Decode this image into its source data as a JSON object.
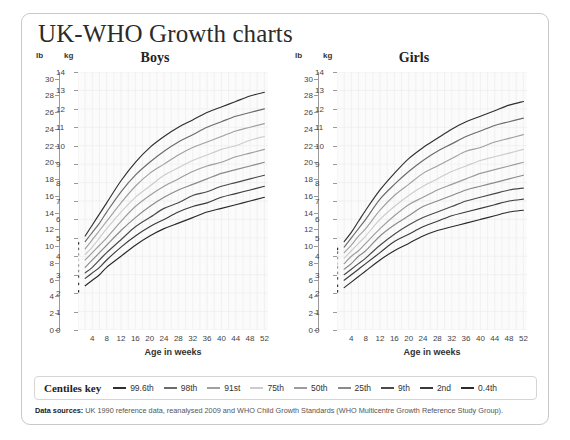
{
  "header": {
    "title": "UK-WHO Growth charts"
  },
  "units": {
    "lb": "lb",
    "kg": "kg"
  },
  "axis": {
    "lb_ticks": [
      30,
      28,
      26,
      24,
      22,
      20,
      18,
      16,
      14,
      12,
      10,
      8,
      6,
      4,
      2,
      0
    ],
    "kg_ticks": [
      14,
      13,
      12,
      11,
      10,
      9,
      8,
      7,
      6,
      5,
      4,
      3,
      2,
      1,
      0
    ],
    "x_ticks": [
      4,
      8,
      12,
      16,
      20,
      24,
      28,
      32,
      36,
      40,
      44,
      48,
      52
    ],
    "x_title": "Age in weeks"
  },
  "legend": {
    "title": "Centiles key",
    "items": [
      {
        "label": "99.6th",
        "color": "#2f2f2f"
      },
      {
        "label": "98th",
        "color": "#6b6b6b"
      },
      {
        "label": "91st",
        "color": "#a0a0a0"
      },
      {
        "label": "75th",
        "color": "#cccccc"
      },
      {
        "label": "50th",
        "color": "#9d9d9d"
      },
      {
        "label": "25th",
        "color": "#8a8a8a"
      },
      {
        "label": "9th",
        "color": "#4a4a4a"
      },
      {
        "label": "2nd",
        "color": "#3a3a3a"
      },
      {
        "label": "0.4th",
        "color": "#2a2a2a"
      }
    ]
  },
  "footer": {
    "label": "Data sources:",
    "text": " UK 1990 reference data, reanalysed 2009 and WHO Child Growth Standards (WHO Multicentre Growth Reference Study Group)."
  },
  "chart_data": {
    "type": "line",
    "title": "UK-WHO Growth charts",
    "xlabel": "Age in weeks",
    "ylabel": "kg",
    "ylabel_secondary": "lb",
    "xlim": [
      0,
      53
    ],
    "ylim": [
      0,
      14
    ],
    "ylim_lb": [
      0,
      30.8
    ],
    "grid": true,
    "legend_position": "bottom",
    "panels": [
      {
        "name": "Boys",
        "title": "Boys",
        "x": [
          0,
          2,
          4,
          6,
          8,
          12,
          16,
          20,
          24,
          28,
          32,
          36,
          40,
          44,
          48,
          52
        ],
        "birth_dots_kg": [
          4.7,
          4.4,
          4.1,
          3.8,
          3.5,
          3.2,
          2.9,
          2.5,
          2.1
        ],
        "series": [
          {
            "name": "99.6th",
            "color": "#2f2f2f",
            "values": [
              4.7,
              5.1,
              5.7,
              6.3,
              6.9,
              8.1,
              9.1,
              9.9,
              10.5,
              11.0,
              11.4,
              11.8,
              12.1,
              12.4,
              12.7,
              12.9
            ]
          },
          {
            "name": "98th",
            "color": "#6b6b6b",
            "values": [
              4.4,
              4.8,
              5.3,
              5.8,
              6.4,
              7.5,
              8.4,
              9.1,
              9.7,
              10.2,
              10.6,
              11.0,
              11.3,
              11.6,
              11.8,
              12.0
            ]
          },
          {
            "name": "91st",
            "color": "#a0a0a0",
            "values": [
              4.1,
              4.4,
              4.9,
              5.4,
              5.9,
              6.9,
              7.8,
              8.5,
              9.0,
              9.5,
              9.9,
              10.2,
              10.5,
              10.8,
              11.0,
              11.2
            ]
          },
          {
            "name": "75th",
            "color": "#cccccc",
            "values": [
              3.8,
              4.1,
              4.5,
              5.0,
              5.5,
              6.4,
              7.2,
              7.8,
              8.4,
              8.8,
              9.2,
              9.5,
              9.8,
              10.0,
              10.3,
              10.5
            ]
          },
          {
            "name": "50th",
            "color": "#9d9d9d",
            "values": [
              3.5,
              3.8,
              4.2,
              4.6,
              5.0,
              5.9,
              6.7,
              7.3,
              7.8,
              8.2,
              8.6,
              8.9,
              9.1,
              9.4,
              9.6,
              9.8
            ]
          },
          {
            "name": "25th",
            "color": "#8a8a8a",
            "values": [
              3.2,
              3.4,
              3.8,
              4.2,
              4.6,
              5.4,
              6.1,
              6.7,
              7.2,
              7.6,
              7.9,
              8.2,
              8.5,
              8.7,
              8.9,
              9.1
            ]
          },
          {
            "name": "9th",
            "color": "#4a4a4a",
            "values": [
              2.9,
              3.1,
              3.4,
              3.8,
              4.2,
              4.9,
              5.6,
              6.1,
              6.6,
              6.9,
              7.3,
              7.5,
              7.8,
              8.0,
              8.2,
              8.4
            ]
          },
          {
            "name": "2nd",
            "color": "#3a3a3a",
            "values": [
              2.5,
              2.8,
              3.1,
              3.4,
              3.8,
              4.5,
              5.1,
              5.6,
              6.0,
              6.4,
              6.7,
              6.9,
              7.2,
              7.4,
              7.6,
              7.8
            ]
          },
          {
            "name": "0.4th",
            "color": "#2a2a2a",
            "values": [
              2.1,
              2.4,
              2.7,
              3.0,
              3.4,
              4.0,
              4.6,
              5.1,
              5.5,
              5.8,
              6.1,
              6.4,
              6.6,
              6.8,
              7.0,
              7.2
            ]
          }
        ]
      },
      {
        "name": "Girls",
        "title": "Girls",
        "x": [
          0,
          2,
          4,
          6,
          8,
          12,
          16,
          20,
          24,
          28,
          32,
          36,
          40,
          44,
          48,
          52
        ],
        "birth_dots_kg": [
          4.4,
          4.2,
          3.9,
          3.6,
          3.4,
          3.1,
          2.8,
          2.4,
          2.1
        ],
        "series": [
          {
            "name": "99.6th",
            "color": "#2f2f2f",
            "values": [
              4.4,
              4.8,
              5.3,
              5.9,
              6.5,
              7.6,
              8.5,
              9.3,
              9.9,
              10.4,
              10.9,
              11.3,
              11.6,
              11.9,
              12.2,
              12.4
            ]
          },
          {
            "name": "98th",
            "color": "#6b6b6b",
            "values": [
              4.2,
              4.5,
              5.0,
              5.5,
              6.0,
              7.1,
              7.9,
              8.6,
              9.2,
              9.7,
              10.1,
              10.5,
              10.8,
              11.1,
              11.3,
              11.5
            ]
          },
          {
            "name": "91st",
            "color": "#a0a0a0",
            "values": [
              3.9,
              4.2,
              4.6,
              5.1,
              5.5,
              6.5,
              7.3,
              7.9,
              8.5,
              8.9,
              9.3,
              9.7,
              9.9,
              10.2,
              10.4,
              10.6
            ]
          },
          {
            "name": "75th",
            "color": "#cccccc",
            "values": [
              3.6,
              3.9,
              4.3,
              4.7,
              5.1,
              6.0,
              6.7,
              7.3,
              7.8,
              8.2,
              8.6,
              8.9,
              9.2,
              9.4,
              9.6,
              9.8
            ]
          },
          {
            "name": "50th",
            "color": "#9d9d9d",
            "values": [
              3.4,
              3.6,
              4.0,
              4.3,
              4.7,
              5.5,
              6.2,
              6.8,
              7.2,
              7.6,
              7.9,
              8.2,
              8.5,
              8.7,
              8.9,
              9.1
            ]
          },
          {
            "name": "25th",
            "color": "#8a8a8a",
            "values": [
              3.1,
              3.3,
              3.6,
              4.0,
              4.3,
              5.1,
              5.7,
              6.2,
              6.7,
              7.0,
              7.3,
              7.6,
              7.8,
              8.0,
              8.2,
              8.4
            ]
          },
          {
            "name": "9th",
            "color": "#4a4a4a",
            "values": [
              2.8,
              3.0,
              3.3,
              3.6,
              3.9,
              4.6,
              5.2,
              5.7,
              6.1,
              6.4,
              6.7,
              7.0,
              7.2,
              7.4,
              7.6,
              7.7
            ]
          },
          {
            "name": "2nd",
            "color": "#3a3a3a",
            "values": [
              2.4,
              2.7,
              3.0,
              3.3,
              3.6,
              4.2,
              4.8,
              5.2,
              5.6,
              5.9,
              6.2,
              6.4,
              6.6,
              6.8,
              7.0,
              7.1
            ]
          },
          {
            "name": "0.4th",
            "color": "#2a2a2a",
            "values": [
              2.1,
              2.3,
              2.6,
              2.9,
              3.2,
              3.8,
              4.3,
              4.7,
              5.1,
              5.4,
              5.6,
              5.8,
              6.0,
              6.2,
              6.4,
              6.5
            ]
          }
        ]
      }
    ]
  }
}
